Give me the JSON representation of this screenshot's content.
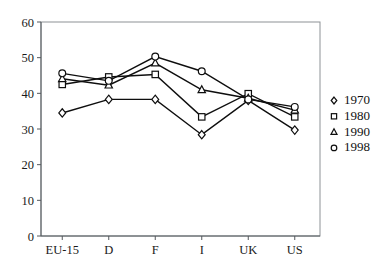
{
  "chart_data": {
    "type": "line",
    "title": "",
    "subtitle": "",
    "xlabel": "",
    "ylabel": "",
    "categories": [
      "EU-15",
      "D",
      "F",
      "I",
      "UK",
      "US"
    ],
    "ylim": [
      0,
      60
    ],
    "yticks": [
      0,
      10,
      20,
      30,
      40,
      50,
      60
    ],
    "ytick_labels": [
      "0",
      "10",
      "20",
      "30",
      "40",
      "50",
      "60"
    ],
    "grid": false,
    "legend_position": "right",
    "series": [
      {
        "name": "1970",
        "marker": "diamond",
        "values": [
          34.5,
          38.3,
          38.3,
          28.4,
          38.0,
          29.7
        ]
      },
      {
        "name": "1980",
        "marker": "square",
        "values": [
          42.5,
          44.6,
          45.3,
          33.4,
          39.9,
          33.4
        ]
      },
      {
        "name": "1990",
        "marker": "triangle",
        "values": [
          44.1,
          42.3,
          48.5,
          41.0,
          38.6,
          35.3
        ]
      },
      {
        "name": "1998",
        "marker": "circle",
        "values": [
          45.6,
          43.5,
          50.3,
          46.2,
          38.3,
          36.2
        ]
      }
    ]
  },
  "legend": {
    "entries": [
      {
        "label": "1970",
        "marker": "diamond"
      },
      {
        "label": "1980",
        "marker": "square"
      },
      {
        "label": "1990",
        "marker": "triangle"
      },
      {
        "label": "1998",
        "marker": "circle"
      }
    ]
  },
  "colors": {
    "line": "#0e0e0e",
    "marker_fill": "#ffffff",
    "axis": "#555a5e",
    "frame": "#8d9296",
    "background": "#ffffff",
    "text": "#1a1a1a"
  }
}
